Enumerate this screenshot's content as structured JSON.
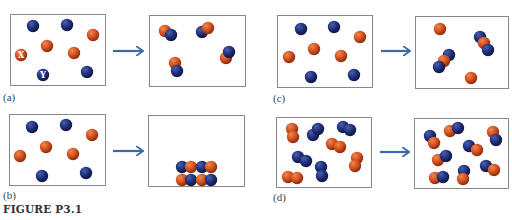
{
  "figure": {
    "title": "FIGURE P3.1",
    "colors": {
      "red": "#d2501e",
      "blue": "#1f2f7a",
      "arrow": "#3a6aa8",
      "border": "#888888"
    },
    "atom_labels": {
      "red": "X",
      "blue": "Y"
    },
    "panels": [
      {
        "id": "a",
        "label": "(a)",
        "label_pos": [
          3,
          91
        ],
        "before": {
          "box": [
            10,
            14,
            95,
            71
          ],
          "atoms": [
            [
              "b",
              33,
              26
            ],
            [
              "b",
              67,
              25
            ],
            [
              "r",
              93,
              35
            ],
            [
              "r",
              47,
              46
            ],
            [
              "r",
              21,
              55,
              "X"
            ],
            [
              "r",
              74,
              53
            ],
            [
              "b",
              43,
              75,
              "Y"
            ],
            [
              "b",
              87,
              72
            ]
          ]
        },
        "arrow": [
          113,
          51,
          142
        ],
        "after": {
          "box": [
            149,
            15,
            96,
            71
          ],
          "atoms": [
            [
              "r",
              165,
              31
            ],
            [
              "b",
              171,
              35
            ],
            [
              "b",
              202,
              32
            ],
            [
              "r",
              208,
              28
            ],
            [
              "r",
              226,
              58
            ],
            [
              "b",
              229,
              52
            ],
            [
              "r",
              175,
              63
            ],
            [
              "b",
              177,
              71
            ]
          ]
        }
      },
      {
        "id": "b",
        "label": "(b)",
        "label_pos": [
          3,
          189
        ],
        "before": {
          "box": [
            9,
            114,
            96,
            71
          ],
          "atoms": [
            [
              "b",
              32,
              127
            ],
            [
              "b",
              66,
              125
            ],
            [
              "r",
              92,
              135
            ],
            [
              "r",
              46,
              147
            ],
            [
              "r",
              20,
              156
            ],
            [
              "r",
              73,
              154
            ],
            [
              "b",
              42,
              176
            ],
            [
              "b",
              86,
              173
            ]
          ]
        },
        "arrow": [
          113,
          151,
          142
        ],
        "after": {
          "box": [
            148,
            115,
            96,
            71
          ],
          "atoms": [
            [
              "b",
              182,
              167
            ],
            [
              "r",
              191,
              167
            ],
            [
              "b",
              202,
              167
            ],
            [
              "r",
              211,
              167
            ],
            [
              "r",
              182,
              180
            ],
            [
              "b",
              191,
              180
            ],
            [
              "r",
              202,
              180
            ],
            [
              "b",
              211,
              180
            ]
          ]
        }
      },
      {
        "id": "c",
        "label": "(c)",
        "label_pos": [
          273,
          92
        ],
        "before": {
          "box": [
            277,
            15,
            95,
            72
          ],
          "atoms": [
            [
              "b",
              301,
              29
            ],
            [
              "b",
              334,
              27
            ],
            [
              "r",
              360,
              37
            ],
            [
              "r",
              314,
              49
            ],
            [
              "r",
              289,
              57
            ],
            [
              "r",
              341,
              56
            ],
            [
              "b",
              311,
              77
            ],
            [
              "b",
              354,
              75
            ]
          ]
        },
        "arrow": [
          381,
          51,
          409
        ],
        "after": {
          "box": [
            415,
            16,
            93,
            72
          ],
          "atoms": [
            [
              "r",
              440,
              29
            ],
            [
              "b",
              480,
              37
            ],
            [
              "r",
              484,
              43
            ],
            [
              "b",
              488,
              50
            ],
            [
              "b",
              449,
              55
            ],
            [
              "r",
              444,
              61
            ],
            [
              "b",
              439,
              67
            ],
            [
              "r",
              471,
              78
            ]
          ]
        }
      },
      {
        "id": "d",
        "label": "(d)",
        "label_pos": [
          273,
          191
        ],
        "before": {
          "box": [
            276,
            117,
            95,
            70
          ],
          "atoms": [
            [
              "r",
              292,
              129
            ],
            [
              "r",
              293,
              137
            ],
            [
              "b",
              313,
              135
            ],
            [
              "b",
              318,
              129
            ],
            [
              "b",
              343,
              127
            ],
            [
              "b",
              350,
              130
            ],
            [
              "r",
              332,
              144
            ],
            [
              "r",
              340,
              147
            ],
            [
              "b",
              298,
              157
            ],
            [
              "b",
              306,
              161
            ],
            [
              "r",
              357,
              158
            ],
            [
              "r",
              355,
              166
            ],
            [
              "r",
              288,
              177
            ],
            [
              "r",
              297,
              178
            ],
            [
              "b",
              321,
              167
            ],
            [
              "b",
              322,
              176
            ]
          ]
        },
        "arrow": [
          380,
          152,
          408
        ],
        "after": {
          "box": [
            414,
            118,
            94,
            70
          ],
          "atoms": [
            [
              "b",
              430,
              136
            ],
            [
              "r",
              434,
              143
            ],
            [
              "r",
              450,
              131
            ],
            [
              "b",
              458,
              128
            ],
            [
              "r",
              493,
              132
            ],
            [
              "b",
              496,
              140
            ],
            [
              "b",
              469,
              146
            ],
            [
              "r",
              477,
              150
            ],
            [
              "r",
              438,
              160
            ],
            [
              "b",
              446,
              156
            ],
            [
              "b",
              486,
              166
            ],
            [
              "r",
              494,
              170
            ],
            [
              "r",
              435,
              178
            ],
            [
              "b",
              443,
              177
            ],
            [
              "b",
              464,
              171
            ],
            [
              "r",
              463,
              179
            ]
          ]
        }
      }
    ]
  }
}
